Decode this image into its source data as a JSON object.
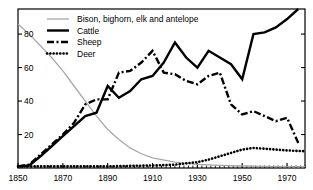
{
  "chart_data": {
    "type": "line",
    "title": "",
    "xlabel": "",
    "ylabel": "",
    "xlim": [
      1850,
      1978
    ],
    "ylim": [
      0,
      95
    ],
    "grid": false,
    "legend_position": "top-left",
    "yticks": [
      20,
      40,
      60,
      80
    ],
    "ytick_labels": [
      "20",
      "40",
      "60",
      "80"
    ],
    "xticks": [
      1850,
      1870,
      1890,
      1910,
      1930,
      1950,
      1970
    ],
    "xtick_labels": [
      "1850",
      "1870",
      "1890",
      "1910",
      "1930",
      "1950",
      "1970"
    ],
    "minor_xtick_step": 2,
    "series": [
      {
        "name": "Bison, bighorn, elk and antelope",
        "style": "solid-thin",
        "color": "#a8a8a8",
        "x": [
          1850,
          1855,
          1860,
          1865,
          1870,
          1875,
          1880,
          1885,
          1890,
          1895,
          1900,
          1905,
          1910,
          1920,
          1930,
          1940,
          1950,
          1960,
          1970,
          1978
        ],
        "values": [
          86,
          80,
          73,
          66,
          58,
          49,
          40,
          31,
          23,
          17,
          12,
          8.5,
          6,
          3.5,
          2.2,
          1.6,
          1.2,
          1.0,
          0.8,
          0.8
        ]
      },
      {
        "name": "Cattle",
        "style": "solid-thick",
        "color": "#000000",
        "x": [
          1850,
          1855,
          1860,
          1865,
          1870,
          1875,
          1880,
          1885,
          1890,
          1895,
          1900,
          1905,
          1910,
          1915,
          1920,
          1925,
          1930,
          1935,
          1940,
          1945,
          1950,
          1955,
          1960,
          1965,
          1970,
          1975
        ],
        "values": [
          1,
          1.5,
          7,
          13,
          19,
          25,
          31,
          33,
          49,
          42,
          46,
          53,
          55,
          63,
          75,
          66,
          60,
          70,
          66,
          62,
          53,
          80,
          81,
          84,
          89,
          95
        ]
      },
      {
        "name": "Sheep",
        "style": "dashdot",
        "color": "#000000",
        "x": [
          1850,
          1855,
          1860,
          1865,
          1870,
          1875,
          1880,
          1885,
          1890,
          1895,
          1900,
          1905,
          1910,
          1915,
          1920,
          1925,
          1930,
          1935,
          1940,
          1945,
          1950,
          1955,
          1960,
          1965,
          1970,
          1975
        ],
        "values": [
          1,
          2,
          8,
          14,
          20,
          27,
          38,
          41,
          41,
          57,
          58,
          63,
          70,
          57,
          56,
          52,
          50,
          55,
          57,
          38,
          32,
          34,
          31,
          28,
          30,
          15
        ]
      },
      {
        "name": "Deer",
        "style": "dotted",
        "color": "#000000",
        "x": [
          1850,
          1870,
          1890,
          1910,
          1920,
          1930,
          1935,
          1940,
          1945,
          1950,
          1955,
          1960,
          1965,
          1970,
          1978
        ],
        "values": [
          1,
          1,
          1,
          1.5,
          2,
          3.5,
          5,
          7,
          9,
          11,
          12,
          11.5,
          11,
          10.5,
          10
        ]
      }
    ]
  },
  "legend": {
    "items": [
      {
        "label": "Bison, bighorn, elk and antelope",
        "style": "solid-thin"
      },
      {
        "label": "Cattle",
        "style": "solid-thick"
      },
      {
        "label": "Sheep",
        "style": "dashdot"
      },
      {
        "label": "Deer",
        "style": "dotted"
      }
    ]
  }
}
